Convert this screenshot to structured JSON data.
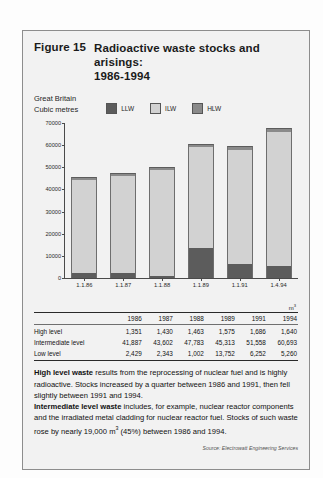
{
  "figure": {
    "number": "Figure 15",
    "title": "Radioactive waste stocks and arisings:\n1986-1994",
    "region": "Great Britain",
    "unit_caption": "Cubic metres",
    "unit_symbol": "m",
    "unit_exponent": "3",
    "source": "Source: Electrowatt Engineering Services"
  },
  "legend": [
    {
      "label": "LLW",
      "color": "#5c5c5c"
    },
    {
      "label": "ILW",
      "color": "#d2d2d2"
    },
    {
      "label": "HLW",
      "color": "#8a8a8a"
    }
  ],
  "chart_data": {
    "type": "bar",
    "subtype": "stacked",
    "title": "Radioactive waste stocks and arisings: 1986-1994",
    "xlabel": "",
    "ylabel": "Cubic metres",
    "categories": [
      "1.1.86",
      "1.1.87",
      "1.1.88",
      "1.1.89",
      "1.1.91",
      "1.4.94"
    ],
    "series": [
      {
        "name": "LLW",
        "label": "Low level",
        "color": "#5c5c5c",
        "values": [
          2429,
          2343,
          1002,
          13752,
          6252,
          5260
        ]
      },
      {
        "name": "ILW",
        "label": "Intermediate level",
        "color": "#d2d2d2",
        "values": [
          41887,
          43602,
          47783,
          45313,
          51558,
          60693
        ]
      },
      {
        "name": "HLW",
        "label": "High level",
        "color": "#8a8a8a",
        "values": [
          1351,
          1430,
          1463,
          1575,
          1686,
          1640
        ]
      }
    ],
    "totals": [
      45667,
      47375,
      50248,
      60640,
      59496,
      67593
    ],
    "ylim": [
      0,
      70000
    ],
    "yticks": [
      0,
      10000,
      20000,
      30000,
      40000,
      50000,
      60000,
      70000
    ],
    "ytick_labels": [
      "0",
      "10000",
      "20000",
      "30000",
      "40000",
      "50000",
      "60000",
      "70000"
    ],
    "grid": false,
    "legend_position": "top-right"
  },
  "table": {
    "unit": "m",
    "unit_exponent": "3",
    "row_header": "",
    "columns": [
      "1986",
      "1987",
      "1988",
      "1989",
      "1991",
      "1994"
    ],
    "rows": [
      {
        "label": "High level",
        "values": [
          "1,351",
          "1,430",
          "1,463",
          "1,575",
          "1,686",
          "1,640"
        ]
      },
      {
        "label": "Intermediate level",
        "values": [
          "41,887",
          "43,602",
          "47,783",
          "45,313",
          "51,558",
          "60,693"
        ]
      },
      {
        "label": "Low level",
        "values": [
          "2,429",
          "2,343",
          "1,002",
          "13,752",
          "6,252",
          "5,260"
        ]
      }
    ]
  },
  "notes": {
    "p1_bold": "High level waste",
    "p1_rest": " results from the reprocessing of nuclear fuel and is highly radioactive. Stocks increased by a quarter between 1986 and 1991, then fell slightly between 1991 and 1994.",
    "p2_bold": "Intermediate level waste",
    "p2_rest_a": " includes, for example, nuclear reactor components and the irradiated metal cladding for nuclear reactor fuel. Stocks of such waste rose by nearly 19,000 m",
    "p2_sup": "3",
    "p2_rest_b": " (45%) between 1986 and 1994."
  }
}
